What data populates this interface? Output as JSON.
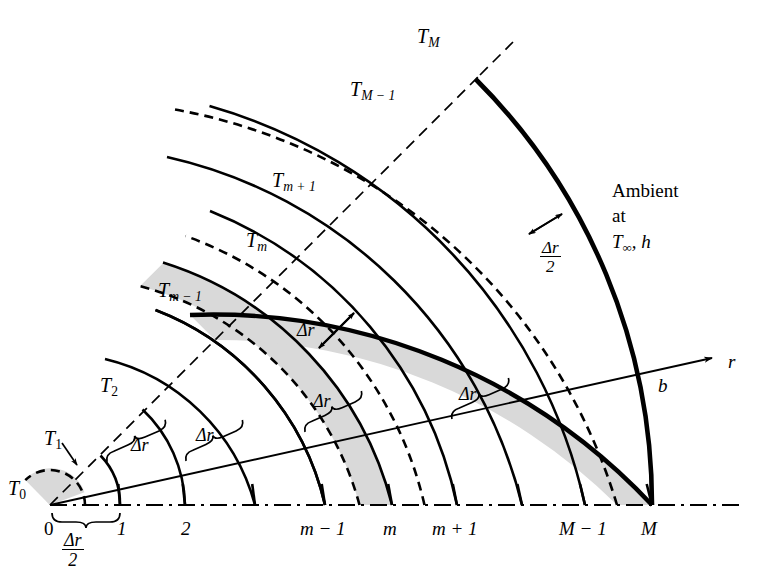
{
  "figure": {
    "type": "annular-finite-difference-mesh",
    "colors": {
      "background": "#ffffff",
      "line": "#000000",
      "shaded_control_volume": "#d9d9d9"
    }
  },
  "surface_temperature_labels": [
    {
      "id": "T0",
      "base": "T",
      "sub": "0",
      "x": 8,
      "y": 478
    },
    {
      "id": "T1",
      "base": "T",
      "sub": "1",
      "x": 44,
      "y": 428
    },
    {
      "id": "T2",
      "base": "T",
      "sub": "2",
      "x": 100,
      "y": 375
    },
    {
      "id": "Tm1",
      "base": "T",
      "sub": "m − 1",
      "x": 158,
      "y": 280
    },
    {
      "id": "Tm",
      "base": "T",
      "sub": "m",
      "x": 246,
      "y": 230
    },
    {
      "id": "Tmp1",
      "base": "T",
      "sub": "m + 1",
      "x": 272,
      "y": 170
    },
    {
      "id": "TM1",
      "base": "T",
      "sub": "M − 1",
      "x": 350,
      "y": 79
    },
    {
      "id": "TM",
      "base": "T",
      "sub": "M",
      "x": 417,
      "y": 26
    }
  ],
  "node_index_labels": [
    {
      "id": "n0",
      "text": "0",
      "x": 44,
      "y": 523
    },
    {
      "id": "n1",
      "text": "1",
      "x": 117,
      "y": 523
    },
    {
      "id": "n2",
      "text": "2",
      "x": 181,
      "y": 523
    },
    {
      "id": "nm1",
      "text": "m − 1",
      "x": 300,
      "y": 523
    },
    {
      "id": "nm",
      "text": "m",
      "x": 383,
      "y": 523
    },
    {
      "id": "nmp1",
      "text": "m + 1",
      "x": 432,
      "y": 523
    },
    {
      "id": "nM1",
      "text": "M − 1",
      "x": 559,
      "y": 523
    },
    {
      "id": "nM",
      "text": "M",
      "x": 641,
      "y": 523
    }
  ],
  "spacing_labels": [
    {
      "id": "dr_axis_1",
      "text": "Δr",
      "x": 131,
      "y": 440
    },
    {
      "id": "dr_axis_2",
      "text": "Δr",
      "x": 196,
      "y": 430
    },
    {
      "id": "dr_axis_3",
      "text": "Δr",
      "x": 313,
      "y": 396
    },
    {
      "id": "dr_axis_4",
      "text": "Δr",
      "x": 459,
      "y": 389
    },
    {
      "id": "dr_radial",
      "text": "Δr",
      "x": 297,
      "y": 325
    }
  ],
  "fraction_labels": [
    {
      "id": "dr_half_origin",
      "numerator": "Δr",
      "denominator": "2",
      "x": 62,
      "y": 535
    },
    {
      "id": "dr_half_outer",
      "numerator": "Δr",
      "denominator": "2",
      "x": 540,
      "y": 243
    }
  ],
  "axis": {
    "r_label": {
      "text": "r",
      "x": 728,
      "y": 357
    },
    "b_label": {
      "text": "b",
      "x": 658,
      "y": 381
    }
  },
  "ambient_note": {
    "line1": "Ambient",
    "line2": "at",
    "line3_base": "T",
    "line3_sub": "∞",
    "line3_tail": ", h",
    "x": 612,
    "y": 178
  }
}
